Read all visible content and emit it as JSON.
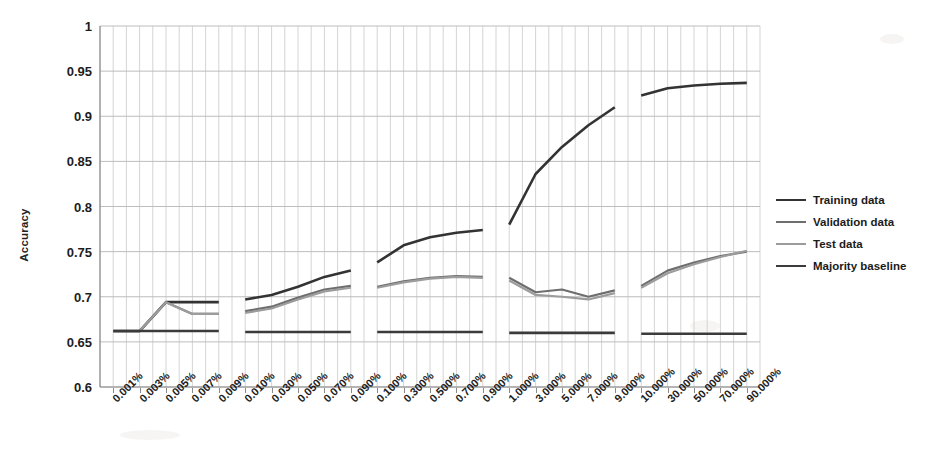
{
  "chart_data": {
    "type": "line",
    "title": "",
    "xlabel": "",
    "ylabel": "Accuracy",
    "ylim": [
      0.6,
      1.0
    ],
    "yticks": [
      0.6,
      0.65,
      0.7,
      0.75,
      0.8,
      0.85,
      0.9,
      0.95,
      1
    ],
    "ytick_labels": [
      "0.6",
      "0.65",
      "0.7",
      "0.75",
      "0.8",
      "0.85",
      "0.9",
      "0.95",
      "1"
    ],
    "grid": true,
    "grid_minor_vertical": true,
    "legend_position": "right",
    "categories": [
      "0.001%",
      "0.003%",
      "0.005%",
      "0.007%",
      "0.009%",
      "0.010%",
      "0.030%",
      "0.050%",
      "0.070%",
      "0.090%",
      "0.100%",
      "0.300%",
      "0.500%",
      "0.700%",
      "0.900%",
      "1.000%",
      "3.000%",
      "5.000%",
      "7.000%",
      "9.000%",
      "10.000%",
      "30.000%",
      "50.000%",
      "70.000%",
      "90.000%"
    ],
    "segment_breaks": [
      5,
      10,
      15,
      20
    ],
    "series": [
      {
        "name": "Training data",
        "color": "#333333",
        "width": 2.6,
        "values": [
          0.662,
          0.662,
          0.694,
          0.694,
          0.694,
          0.697,
          0.702,
          0.711,
          0.722,
          0.729,
          0.738,
          0.757,
          0.766,
          0.771,
          0.774,
          0.78,
          0.836,
          0.866,
          0.89,
          0.91,
          0.923,
          0.931,
          0.934,
          0.936,
          0.937
        ]
      },
      {
        "name": "Validation data",
        "color": "#6e6e6e",
        "width": 2.2,
        "values": [
          0.662,
          0.662,
          0.694,
          0.681,
          0.681,
          0.684,
          0.689,
          0.699,
          0.708,
          0.712,
          0.711,
          0.717,
          0.721,
          0.723,
          0.722,
          0.721,
          0.705,
          0.708,
          0.7,
          0.707,
          0.712,
          0.729,
          0.738,
          0.745,
          0.75
        ]
      },
      {
        "name": "Test data",
        "color": "#9c9c9c",
        "width": 2.2,
        "values": [
          0.662,
          0.662,
          0.694,
          0.681,
          0.681,
          0.682,
          0.687,
          0.697,
          0.706,
          0.71,
          0.71,
          0.716,
          0.72,
          0.722,
          0.721,
          0.718,
          0.702,
          0.7,
          0.697,
          0.704,
          0.71,
          0.726,
          0.736,
          0.744,
          0.751
        ]
      },
      {
        "name": "Majority baseline",
        "color": "#3b3b3b",
        "width": 2.6,
        "values": [
          0.662,
          0.662,
          0.662,
          0.662,
          0.662,
          0.661,
          0.661,
          0.661,
          0.661,
          0.661,
          0.661,
          0.661,
          0.661,
          0.661,
          0.661,
          0.66,
          0.66,
          0.66,
          0.66,
          0.66,
          0.659,
          0.659,
          0.659,
          0.659,
          0.659
        ]
      }
    ]
  },
  "legend": {
    "entries": [
      {
        "label": "Training data"
      },
      {
        "label": "Validation data"
      },
      {
        "label": "Test data"
      },
      {
        "label": "Majority baseline"
      }
    ]
  },
  "axes": {
    "y_title": "Accuracy"
  },
  "colors": {
    "grid": "#bdbdbd",
    "grid_minor": "#cfcfcf",
    "axis": "#8a8a8a",
    "background": "#ffffff"
  }
}
